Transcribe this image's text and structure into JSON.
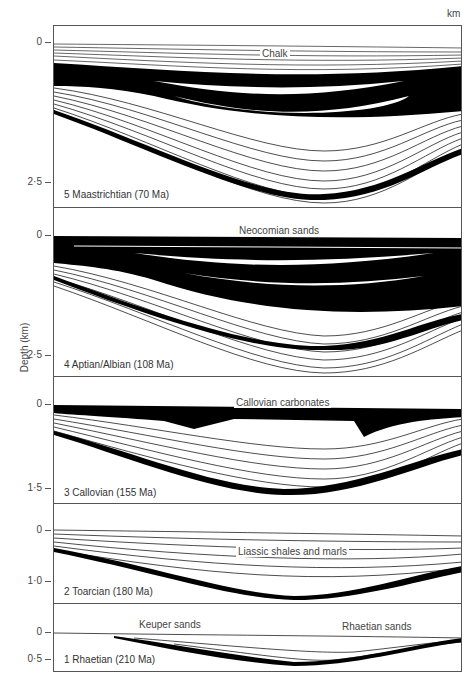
{
  "figure": {
    "unit_label": "km",
    "y_axis_label": "Depth (km)"
  },
  "panels": [
    {
      "stage": "5 Maastrichtian (70 Ma)",
      "formation": "Chalk",
      "ticks": [
        "0",
        "2·5"
      ]
    },
    {
      "stage": "4 Aptian/Albian (108 Ma)",
      "formation": "Neocomian sands",
      "ticks": [
        "0",
        "2·5"
      ]
    },
    {
      "stage": "3 Callovian (155 Ma)",
      "formation": "Callovian carbonates",
      "ticks": [
        "0",
        "1·5"
      ]
    },
    {
      "stage": "2 Toarcian (180 Ma)",
      "formation": "Liassic shales and marls",
      "ticks": [
        "0",
        "1·0"
      ]
    },
    {
      "stage": "1 Rhaetian (210 Ma)",
      "formation_left": "Keuper sands",
      "formation_right": "Rhaetian sands",
      "ticks": [
        "0",
        "0·5"
      ]
    }
  ],
  "colors": {
    "ink": "#000000",
    "paper": "#ffffff",
    "border": "#555555"
  }
}
